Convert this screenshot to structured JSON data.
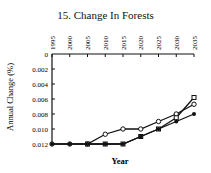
{
  "chart_data": {
    "type": "line",
    "title": "15. Change In Forests",
    "xlabel": "Year",
    "ylabel": "Annual Change (%)",
    "x": [
      1995,
      2000,
      2005,
      2010,
      2015,
      2020,
      2025,
      2030,
      2035
    ],
    "x_tick_labels": [
      "1995",
      "2000",
      "2005",
      "2010",
      "2015",
      "2020",
      "2025",
      "2030",
      "2035"
    ],
    "y_tick_labels": [
      "0",
      "0.002",
      "0.004",
      "0.006",
      "0.008",
      "0.010",
      "0.012"
    ],
    "ylim": [
      0,
      0.012
    ],
    "y_inverted": true,
    "x_axis_position": "top",
    "grid": false,
    "series": [
      {
        "name": "Open circles",
        "marker": "open-circle",
        "values": [
          0.012,
          0.012,
          0.012,
          0.0107,
          0.01,
          0.01,
          0.009,
          0.008,
          0.0067
        ]
      },
      {
        "name": "Open squares",
        "marker": "open-square",
        "values": [
          null,
          null,
          0.012,
          0.012,
          0.012,
          0.011,
          0.01,
          0.0085,
          0.0058
        ]
      },
      {
        "name": "Filled circles",
        "marker": "filled-circle",
        "values": [
          0.012,
          0.012,
          0.012,
          0.012,
          0.012,
          0.011,
          0.01,
          0.009,
          0.008
        ]
      }
    ]
  }
}
